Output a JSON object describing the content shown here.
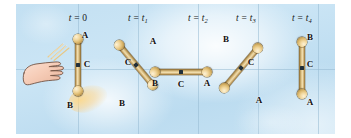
{
  "figure": {
    "background_color": "#c6e2f3",
    "rod_color": "#d8bb7c",
    "ball_color": "#eed9a4",
    "center_mark_color": "#22303a"
  },
  "grid": {
    "horizontal_y": [
      69
    ],
    "vertical_x": [
      78,
      138,
      198,
      258,
      318
    ]
  },
  "panels": [
    {
      "id": "panel-0",
      "time_label": {
        "variable": "t",
        "equals": "=",
        "value": "0",
        "subscript": ""
      },
      "time_label_text": "t = 0",
      "label_x": 78,
      "rod": {
        "cx": 78,
        "cy": 69,
        "angle_deg": 0,
        "length_px": 52
      },
      "points": [
        {
          "name": "A",
          "label": "A",
          "x": 85,
          "y": 35
        },
        {
          "name": "C",
          "label": "C",
          "x": 86,
          "y": 64
        },
        {
          "name": "B",
          "label": "B",
          "x": 70,
          "y": 104
        }
      ],
      "has_hand": true
    },
    {
      "id": "panel-1",
      "time_label": {
        "variable": "t",
        "equals": "=",
        "value": "t",
        "subscript": "1"
      },
      "time_label_text": "t = t1",
      "label_x": 138,
      "rod": {
        "cx": 138,
        "cy": 69,
        "angle_deg": 45,
        "length_px": 52
      },
      "points": [
        {
          "name": "A",
          "label": "A",
          "x": 152,
          "y": 41
        },
        {
          "name": "C",
          "label": "C",
          "x": 129,
          "y": 63
        },
        {
          "name": "B",
          "label": "B",
          "x": 122,
          "y": 102
        }
      ],
      "has_hand": false
    },
    {
      "id": "panel-2",
      "time_label": {
        "variable": "t",
        "equals": "=",
        "value": "t",
        "subscript": "2"
      },
      "time_label_text": "t = t2",
      "label_x": 198,
      "rod": {
        "cx": 180,
        "cy": 69,
        "angle_deg": 90,
        "length_px": 52
      },
      "points": [
        {
          "name": "B",
          "label": "B",
          "x": 155,
          "y": 80
        },
        {
          "name": "C",
          "label": "C",
          "x": 181,
          "y": 81
        },
        {
          "name": "A",
          "label": "A",
          "x": 207,
          "y": 80
        }
      ],
      "has_hand": false
    },
    {
      "id": "panel-3",
      "time_label": {
        "variable": "t",
        "equals": "=",
        "value": "t",
        "subscript": "3"
      },
      "time_label_text": "t = t3",
      "label_x": 241,
      "rod": {
        "cx": 241,
        "cy": 69,
        "angle_deg": 135,
        "length_px": 52
      },
      "points": [
        {
          "name": "B",
          "label": "B",
          "x": 225,
          "y": 40
        },
        {
          "name": "C",
          "label": "C",
          "x": 250,
          "y": 63
        },
        {
          "name": "A",
          "label": "A",
          "x": 257,
          "y": 100
        }
      ],
      "has_hand": false
    },
    {
      "id": "panel-4",
      "time_label": {
        "variable": "t",
        "equals": "=",
        "value": "t",
        "subscript": "4"
      },
      "time_label_text": "t = t4",
      "label_x": 300,
      "rod": {
        "cx": 300,
        "cy": 69,
        "angle_deg": 180,
        "length_px": 52
      },
      "points": [
        {
          "name": "B",
          "label": "B",
          "x": 309,
          "y": 37
        },
        {
          "name": "C",
          "label": "C",
          "x": 309,
          "y": 64
        },
        {
          "name": "A",
          "label": "A",
          "x": 309,
          "y": 102
        }
      ],
      "has_hand": false
    }
  ]
}
